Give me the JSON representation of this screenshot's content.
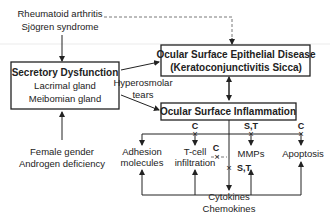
{
  "diagram": {
    "risk_factors_top": [
      "Rheumatoid arthritis",
      "Sjögren syndrome"
    ],
    "risk_factors_bottom": [
      "Female gender",
      "Androgen deficiency"
    ],
    "secretory_box": {
      "title": "Secretory Dysfunction",
      "lines": [
        "Lacrimal gland",
        "Meibomian gland"
      ]
    },
    "epithelial_box": {
      "title": "Ocular Surface Epithelial Disease",
      "subtitle": "(Keratoconjunctivitis Sicca)"
    },
    "hyperosmolar_label": [
      "Hyperosmolar",
      "tears"
    ],
    "inflammation_box": {
      "title": "Ocular Surface Inflammation"
    },
    "outcomes": {
      "adhesion": [
        "Adhesion",
        "molecules"
      ],
      "tcell": [
        "T-cell",
        "infiltration"
      ],
      "mmps": "MMPs",
      "apoptosis": "Apoptosis",
      "cytokines": "Cytokines",
      "chemokines": "Chemokines"
    },
    "inhibitor_labels": {
      "tcell": "C",
      "mmps": "S,T",
      "apoptosis": "C",
      "tcell_to_center": "C",
      "cytokines": "S,T"
    },
    "colors": {
      "line": "#222222",
      "background": "#ffffff"
    }
  }
}
